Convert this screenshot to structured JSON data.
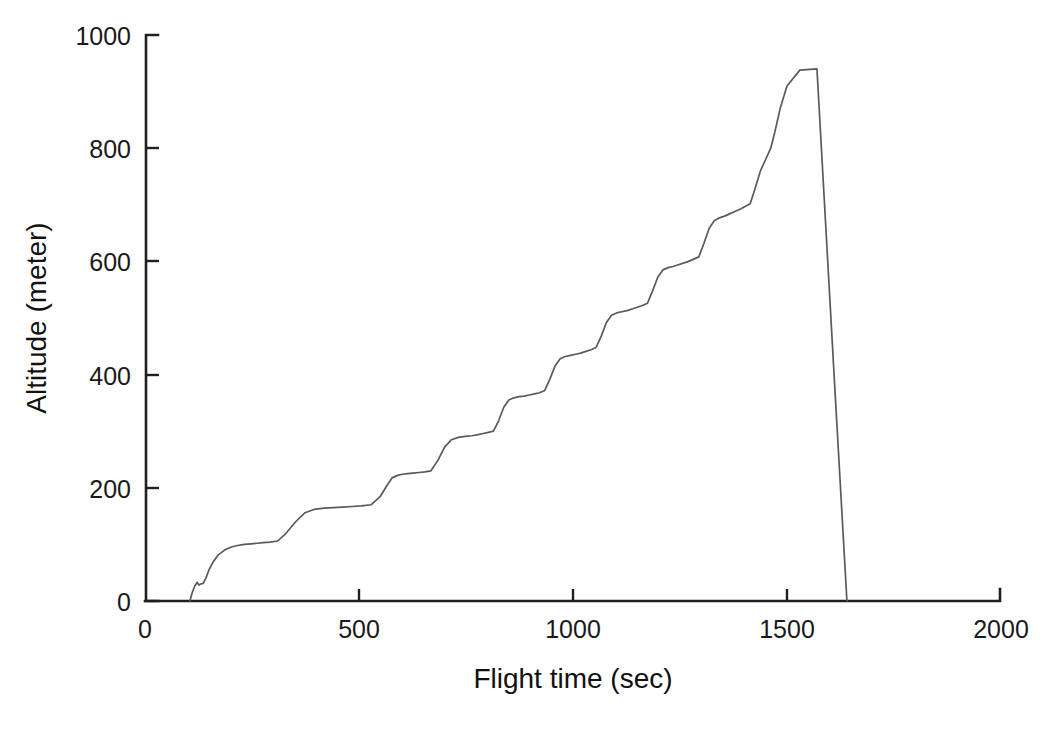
{
  "chart_data": {
    "type": "line",
    "title": "",
    "xlabel": "Flight time (sec)",
    "ylabel": "Altitude (meter)",
    "xlim": [
      0,
      2000
    ],
    "ylim": [
      0,
      1000
    ],
    "xticks": [
      0,
      500,
      1000,
      1500,
      2000
    ],
    "yticks": [
      0,
      200,
      400,
      600,
      800,
      1000
    ],
    "xtick_labels": [
      "0",
      "500",
      "1000",
      "1500",
      "2000"
    ],
    "ytick_labels": [
      "0",
      "200",
      "400",
      "600",
      "800",
      "1000"
    ],
    "grid": false,
    "legend": false,
    "legend_position": "none",
    "line_color": "#5a5a5a",
    "axis_color": "#1f1f1f",
    "background_color": "#ffffff",
    "series": [
      {
        "name": "Altitude profile",
        "x": [
          105,
          110,
          116,
          122,
          126,
          130,
          136,
          142,
          150,
          160,
          172,
          186,
          200,
          216,
          232,
          248,
          262,
          276,
          292,
          310,
          330,
          352,
          374,
          396,
          418,
          440,
          462,
          484,
          506,
          528,
          550,
          566,
          578,
          590,
          602,
          614,
          626,
          640,
          654,
          668,
          684,
          700,
          716,
          732,
          748,
          764,
          778,
          790,
          802,
          814,
          826,
          838,
          850,
          862,
          874,
          886,
          898,
          910,
          922,
          934,
          946,
          958,
          970,
          982,
          994,
          1006,
          1018,
          1030,
          1042,
          1054,
          1066,
          1078,
          1090,
          1102,
          1114,
          1126,
          1138,
          1150,
          1162,
          1174,
          1186,
          1198,
          1210,
          1222,
          1234,
          1246,
          1258,
          1270,
          1282,
          1294,
          1306,
          1318,
          1330,
          1342,
          1354,
          1366,
          1378,
          1390,
          1402,
          1414,
          1426,
          1438,
          1450,
          1462,
          1472,
          1484,
          1500,
          1530,
          1570,
          1610,
          1640
        ],
        "y": [
          0,
          14,
          26,
          33,
          28,
          30,
          31,
          40,
          56,
          70,
          82,
          90,
          95,
          98,
          100,
          101,
          102,
          103,
          104,
          106,
          120,
          140,
          156,
          162,
          164,
          165,
          166,
          167,
          168,
          170,
          185,
          205,
          218,
          222,
          224,
          225,
          226,
          227,
          228,
          230,
          248,
          272,
          285,
          289,
          291,
          292,
          294,
          296,
          298,
          300,
          318,
          342,
          355,
          359,
          361,
          362,
          364,
          366,
          368,
          372,
          392,
          415,
          428,
          432,
          434,
          436,
          438,
          441,
          444,
          448,
          468,
          492,
          505,
          509,
          511,
          513,
          516,
          519,
          522,
          526,
          548,
          572,
          585,
          589,
          591,
          594,
          597,
          600,
          604,
          608,
          632,
          658,
          672,
          677,
          680,
          684,
          688,
          692,
          697,
          702,
          730,
          760,
          780,
          800,
          830,
          870,
          910,
          938,
          940,
          400,
          0
        ]
      }
    ],
    "annotations": {
      "launch_time_sec": 105,
      "peak_altitude_m": 940,
      "peak_time_sec": 1455,
      "landing_time_sec": 1640,
      "step_count": 13,
      "description": "Stepwise altitude ascent followed by a steep near-linear descent"
    }
  },
  "axes": {
    "y_axis_title": "Altitude (meter)",
    "x_axis_title": "Flight time (sec)"
  },
  "caption": {
    "text": ""
  }
}
